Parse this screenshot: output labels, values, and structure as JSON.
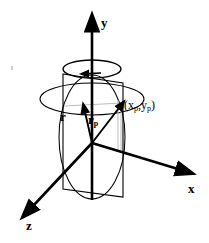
{
  "figure": {
    "background_color": "#ffffff",
    "stroke_color": "#000000",
    "line_thin_color": "#9a9a9a"
  },
  "axes": [
    {
      "id": "y",
      "label": "y",
      "direction": "up",
      "origin": [
        92,
        143
      ],
      "tip": [
        92,
        22
      ],
      "label_pos": [
        101,
        22
      ]
    },
    {
      "id": "x",
      "label": "x",
      "direction": "down-right",
      "origin": [
        92,
        143
      ],
      "tip": [
        186,
        172
      ],
      "label_pos": [
        188,
        188
      ]
    },
    {
      "id": "z",
      "label": "z",
      "direction": "down-left",
      "origin": [
        92,
        143
      ],
      "tip": [
        25,
        213
      ],
      "label_pos": [
        26,
        224
      ]
    }
  ],
  "vectors": [
    {
      "id": "r",
      "label": "r",
      "subscript": "",
      "origin": [
        92,
        143
      ],
      "tip": [
        84,
        106
      ],
      "label_pos": [
        61,
        117
      ]
    },
    {
      "id": "rp",
      "label": "r",
      "subscript": "p",
      "origin": [
        92,
        143
      ],
      "tip": [
        122,
        103
      ],
      "label_pos": [
        88,
        120
      ]
    }
  ],
  "point": {
    "label_main": "(x",
    "sub_1": "p",
    "mid": ",y",
    "sub_2": "p",
    "label_end": ")",
    "position": [
      122,
      103
    ],
    "label_pos": [
      124,
      101
    ]
  },
  "ellipses": [
    {
      "id": "rotation-arrow-ellipse",
      "center": [
        92,
        69
      ],
      "rx": 29,
      "ry": 9,
      "note": "rotation direction indicator around y axis"
    },
    {
      "id": "horizontal-circle",
      "center": [
        92,
        99
      ],
      "rx": 52,
      "ry": 16,
      "note": "horizontal circle of radius r_p"
    },
    {
      "id": "vertical-ellipse",
      "center": [
        92,
        137
      ],
      "rx": 33,
      "ry": 62,
      "note": "vertical circle in the rotating plane"
    }
  ],
  "plane": {
    "id": "rotating-plane",
    "corners": [
      [
        63,
        74
      ],
      [
        123,
        83
      ],
      [
        123,
        197
      ],
      [
        63,
        189
      ]
    ],
    "note": "vertical plane containing the y axis and r_p"
  },
  "rotation": {
    "indicator": "counter-clockwise arrow about y axis",
    "arrow_tip": [
      83,
      74
    ]
  },
  "artifact": {
    "id": "scan-speck",
    "position": [
      11,
      66
    ]
  }
}
